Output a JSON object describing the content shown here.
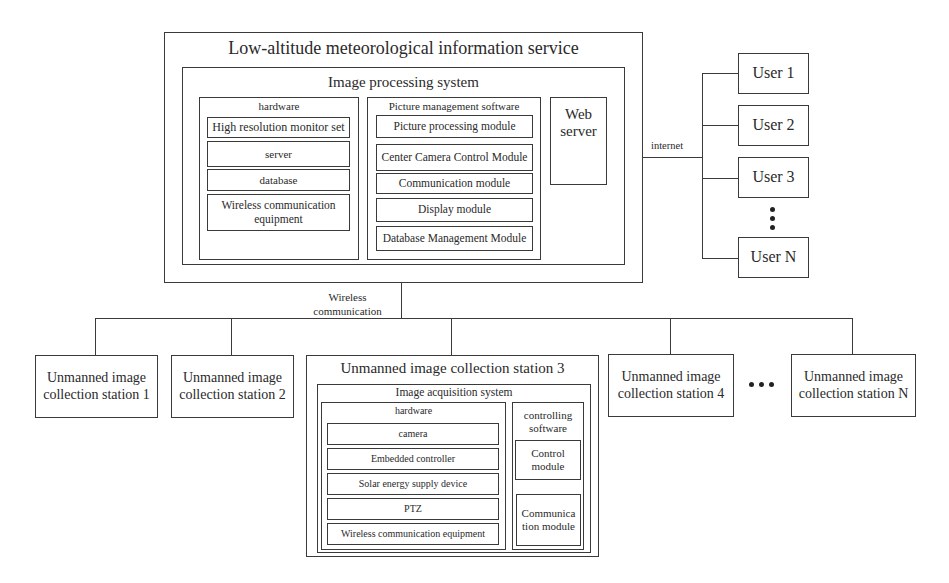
{
  "service": {
    "title": "Low-altitude meteorological information service",
    "image_processing": {
      "title": "Image processing system",
      "hardware": {
        "title": "hardware",
        "items": [
          "High resolution monitor set",
          "server",
          "database",
          "Wireless communication equipment"
        ]
      },
      "software": {
        "title": "Picture management software",
        "items": [
          "Picture processing module",
          "Center Camera Control Module",
          "Communication module",
          "Display module",
          "Database Management Module"
        ]
      },
      "web_server": "Web server"
    }
  },
  "links": {
    "internet": "internet",
    "wireless": "Wireless communication"
  },
  "users": [
    "User 1",
    "User 2",
    "User 3",
    "User N"
  ],
  "stations": {
    "s1": "Unmanned image collection station 1",
    "s2": "Unmanned image collection station 2",
    "s3": {
      "title": "Unmanned image collection station 3",
      "acquisition": {
        "title": "Image acquisition system",
        "hardware": {
          "title": "hardware",
          "items": [
            "camera",
            "Embedded controller",
            "Solar energy supply device",
            "PTZ",
            "Wireless communication equipment"
          ]
        },
        "software": {
          "title": "controlling software",
          "items": [
            "Control module",
            "Communication module"
          ]
        }
      }
    },
    "s4": "Unmanned image collection station 4",
    "sN": "Unmanned image collection station N"
  }
}
